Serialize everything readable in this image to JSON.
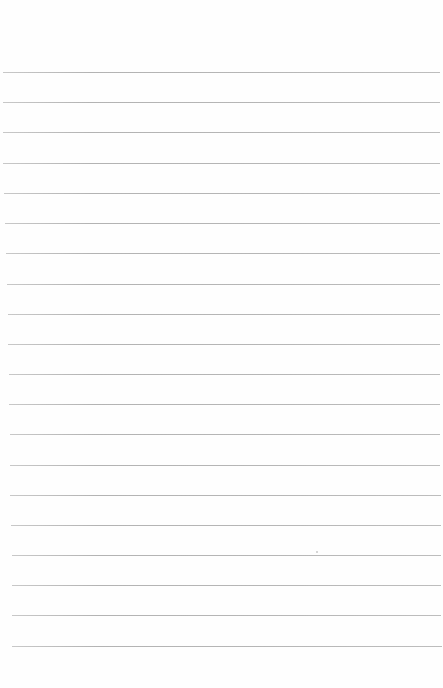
{
  "document": {
    "type": "lined notebook page",
    "content_text": "",
    "background_color": "#fefefe",
    "rule_color": "#b6b6b6",
    "rule_count": 20,
    "rules": [
      {
        "y": 72,
        "x1": 3,
        "x2": 440
      },
      {
        "y": 102,
        "x1": 3,
        "x2": 440
      },
      {
        "y": 132,
        "x1": 3,
        "x2": 440
      },
      {
        "y": 163,
        "x1": 3,
        "x2": 440
      },
      {
        "y": 193,
        "x1": 4,
        "x2": 440
      },
      {
        "y": 223,
        "x1": 5,
        "x2": 440
      },
      {
        "y": 253,
        "x1": 6,
        "x2": 440
      },
      {
        "y": 284,
        "x1": 7,
        "x2": 440
      },
      {
        "y": 314,
        "x1": 8,
        "x2": 440
      },
      {
        "y": 344,
        "x1": 8,
        "x2": 440
      },
      {
        "y": 374,
        "x1": 9,
        "x2": 440
      },
      {
        "y": 404,
        "x1": 9,
        "x2": 440
      },
      {
        "y": 434,
        "x1": 10,
        "x2": 440
      },
      {
        "y": 465,
        "x1": 10,
        "x2": 440
      },
      {
        "y": 495,
        "x1": 10,
        "x2": 441
      },
      {
        "y": 525,
        "x1": 11,
        "x2": 441
      },
      {
        "y": 555,
        "x1": 12,
        "x2": 441
      },
      {
        "y": 585,
        "x1": 12,
        "x2": 441
      },
      {
        "y": 615,
        "x1": 12,
        "x2": 441
      },
      {
        "y": 646,
        "x1": 12,
        "x2": 442
      }
    ],
    "specks": [
      {
        "x": 316,
        "y": 551
      }
    ]
  }
}
